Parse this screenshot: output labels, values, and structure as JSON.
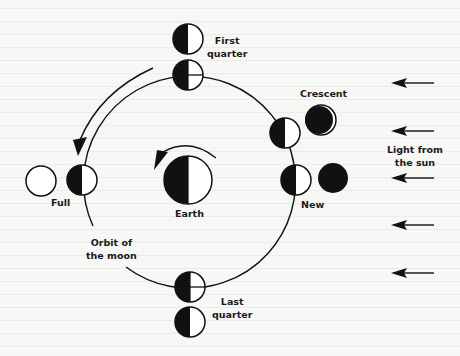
{
  "figure": {
    "colors": {
      "ink": "#111111",
      "paper": "#f7f7f5"
    },
    "labels": {
      "first_quarter": "First quarter",
      "first_quarter_line1": "First",
      "first_quarter_line2": "quarter",
      "crescent": "Crescent",
      "new": "New",
      "full": "Full",
      "earth": "Earth",
      "orbit_line1": "Orbit of",
      "orbit_line2": "the moon",
      "last_quarter_line1": "Last",
      "last_quarter_line2": "quarter",
      "sunlight_line1": "Light from",
      "sunlight_line2": "the sun"
    },
    "orbit": {
      "cx": 188,
      "cy": 181,
      "r": 106
    },
    "earth": {
      "cx": 188,
      "cy": 180,
      "r": 24
    },
    "moons_on_orbit": [
      {
        "phase": "first quarter",
        "cx": 188,
        "cy": 75
      },
      {
        "phase": "crescent",
        "cx": 285,
        "cy": 132
      },
      {
        "phase": "new",
        "cx": 296,
        "cy": 180
      },
      {
        "phase": "full",
        "cx": 82,
        "cy": 180
      },
      {
        "phase": "last quarter",
        "cx": 190,
        "cy": 286
      }
    ],
    "moons_as_seen_from_earth": [
      {
        "phase": "first quarter",
        "appearance": "right half lit"
      },
      {
        "phase": "crescent",
        "appearance": "thin crescent lit on right"
      },
      {
        "phase": "new",
        "appearance": "fully dark"
      },
      {
        "phase": "full",
        "appearance": "fully lit"
      },
      {
        "phase": "last quarter",
        "appearance": "right half lit"
      }
    ],
    "sunlight_arrows": 5,
    "sunlight_direction": "right-to-left"
  }
}
